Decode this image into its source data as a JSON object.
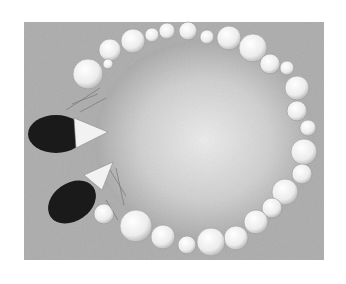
{
  "image": {
    "description": "Grayscale pencil illustration of a ring of pearls on a textured gray background with two dark-tipped objects resting at the left",
    "colors": {
      "background": "#ffffff",
      "paper": "#a8a8a8",
      "center_glow": "#e6e6e6",
      "pearl": "#f0f0f0",
      "dark_tip": "#1a1a1a"
    },
    "pearls": [
      {
        "cx": 110,
        "cy": 50,
        "r": 11
      },
      {
        "cx": 133,
        "cy": 41,
        "r": 12
      },
      {
        "cx": 152,
        "cy": 35,
        "r": 7
      },
      {
        "cx": 167,
        "cy": 31,
        "r": 8
      },
      {
        "cx": 188,
        "cy": 31,
        "r": 9
      },
      {
        "cx": 207,
        "cy": 37,
        "r": 7
      },
      {
        "cx": 229,
        "cy": 38,
        "r": 12
      },
      {
        "cx": 253,
        "cy": 48,
        "r": 14
      },
      {
        "cx": 270,
        "cy": 64,
        "r": 10
      },
      {
        "cx": 287,
        "cy": 68,
        "r": 7
      },
      {
        "cx": 297,
        "cy": 88,
        "r": 12
      },
      {
        "cx": 297,
        "cy": 111,
        "r": 10
      },
      {
        "cx": 308,
        "cy": 128,
        "r": 8
      },
      {
        "cx": 304,
        "cy": 152,
        "r": 13
      },
      {
        "cx": 302,
        "cy": 174,
        "r": 10
      },
      {
        "cx": 285,
        "cy": 192,
        "r": 13
      },
      {
        "cx": 272,
        "cy": 208,
        "r": 10
      },
      {
        "cx": 256,
        "cy": 222,
        "r": 12
      },
      {
        "cx": 236,
        "cy": 238,
        "r": 12
      },
      {
        "cx": 211,
        "cy": 242,
        "r": 14
      },
      {
        "cx": 187,
        "cy": 245,
        "r": 9
      },
      {
        "cx": 163,
        "cy": 237,
        "r": 12
      },
      {
        "cx": 136,
        "cy": 226,
        "r": 16
      },
      {
        "cx": 104,
        "cy": 214,
        "r": 10
      },
      {
        "cx": 88,
        "cy": 74,
        "r": 15
      },
      {
        "cx": 108,
        "cy": 64,
        "r": 5
      }
    ],
    "objects": [
      {
        "name": "upper-tip",
        "dark": {
          "cx": 56,
          "cy": 134,
          "rx": 28,
          "ry": 19
        },
        "light": {
          "x1": 74,
          "y1": 118,
          "x2": 108,
          "y2": 132,
          "x3": 76,
          "y3": 148
        }
      },
      {
        "name": "lower-tip",
        "dark": {
          "cx": 72,
          "cy": 202,
          "rx": 26,
          "ry": 19
        },
        "light": {
          "x1": 84,
          "y1": 175,
          "x2": 113,
          "y2": 162,
          "x3": 102,
          "y3": 190
        }
      }
    ]
  }
}
